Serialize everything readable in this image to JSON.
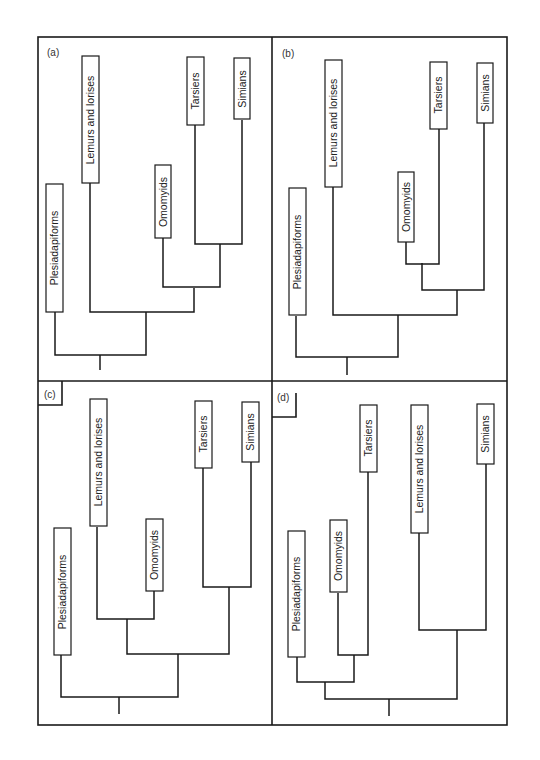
{
  "figure": {
    "panels": [
      {
        "label": "(a)",
        "taxa": [
          "Plesiadapiforms",
          "Lemurs and lorises",
          "Omomyids",
          "Tarsiers",
          "Simians"
        ],
        "topology": "(Plesiadapiforms,(Lemurs and lorises,(Omomyids,(Tarsiers,Simians))))"
      },
      {
        "label": "(b)",
        "taxa": [
          "Plesiadapiforms",
          "Lemurs and lorises",
          "Omomyids",
          "Tarsiers",
          "Simians"
        ],
        "topology": "(Plesiadapiforms,(Lemurs and lorises,((Omomyids,Tarsiers),Simians)))"
      },
      {
        "label": "(c)",
        "taxa": [
          "Plesiadapiforms",
          "Lemurs and lorises",
          "Omomyids",
          "Tarsiers",
          "Simians"
        ],
        "topology": "(Plesiadapiforms,((Lemurs and lorises,Omomyids),(Tarsiers,Simians)))"
      },
      {
        "label": "(d)",
        "taxa": [
          "Plesiadapiforms",
          "Omomyids",
          "Tarsiers",
          "Lemurs and lorises",
          "Simians"
        ],
        "topology": "((Plesiadapiforms,(Omomyids,Tarsiers)),(Lemurs and lorises,Simians))"
      }
    ]
  }
}
